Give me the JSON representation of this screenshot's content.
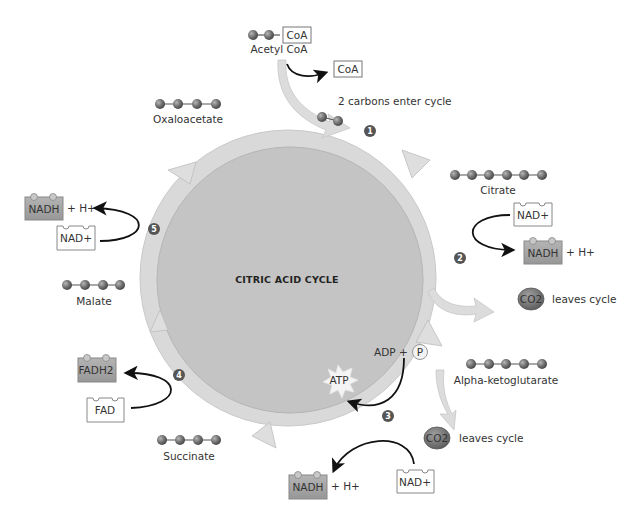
{
  "diagram": {
    "title": "Citric Acid Cycle",
    "title_display": "CITRIC ACID CYCLE",
    "colors": {
      "ring": "#d8d8d8",
      "ring_stroke": "#c4c4c4",
      "inner": "#c2c2c2",
      "arrow": "#dcdcdc",
      "molecule": "#6e6e6e",
      "carrier_reduced": "#a8a8a8",
      "step_badge": "#555555"
    },
    "input": {
      "acetyl_coa_label": "Acetyl CoA",
      "acetyl_coa_box": "CoA",
      "released_coa": "CoA",
      "enter_note": "2 carbons enter cycle"
    },
    "molecules": [
      {
        "name": "Oxaloacetate",
        "carbons": 4
      },
      {
        "name": "Citrate",
        "carbons": 6
      },
      {
        "name": "Alpha-ketoglutarate",
        "carbons": 5
      },
      {
        "name": "Succinate",
        "carbons": 4
      },
      {
        "name": "Malate",
        "carbons": 4
      }
    ],
    "steps": [
      {
        "number": "1"
      },
      {
        "number": "2",
        "in": "NAD+",
        "out": "NADH",
        "extra": "+ H+",
        "co2": "CO2",
        "co2_note": "leaves cycle"
      },
      {
        "number": "3",
        "in": "NAD+",
        "out": "NADH",
        "extra": "+ H+",
        "co2": "CO2",
        "co2_note": "leaves cycle",
        "adp": "ADP +",
        "phosphate": "P",
        "atp": "ATP"
      },
      {
        "number": "4",
        "in": "FAD",
        "out": "FADH2"
      },
      {
        "number": "5",
        "in": "NAD+",
        "out": "NADH",
        "extra": "+ H+"
      }
    ]
  }
}
